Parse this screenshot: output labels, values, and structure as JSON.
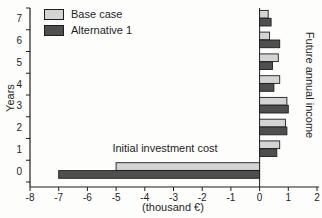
{
  "chart_data": {
    "type": "bar",
    "orientation": "horizontal",
    "title": "",
    "xlabel": "(thousand €)",
    "ylabel": "Years",
    "right_axis_label": "Future annual income",
    "annotation": "Initial investment cost",
    "categories": [
      "7",
      "6",
      "5",
      "4",
      "3",
      "2",
      "1",
      "0"
    ],
    "series": [
      {
        "name": "Base case",
        "color": "#d4d4d4",
        "values": [
          0.3,
          0.35,
          0.65,
          0.7,
          0.95,
          0.9,
          0.7,
          -5.0
        ]
      },
      {
        "name": "Alternative 1",
        "color": "#4f4f4f",
        "values": [
          0.4,
          0.7,
          0.45,
          0.5,
          1.0,
          0.95,
          0.6,
          -7.0
        ]
      }
    ],
    "xlim": [
      -8,
      2
    ],
    "x_ticks": [
      -8,
      -7,
      -6,
      -5,
      -4,
      -3,
      -2,
      -1,
      0,
      1,
      2
    ],
    "grid": false,
    "legend_position": "top-left",
    "axis_color": "#1e1e1e",
    "units": "thousand €"
  }
}
